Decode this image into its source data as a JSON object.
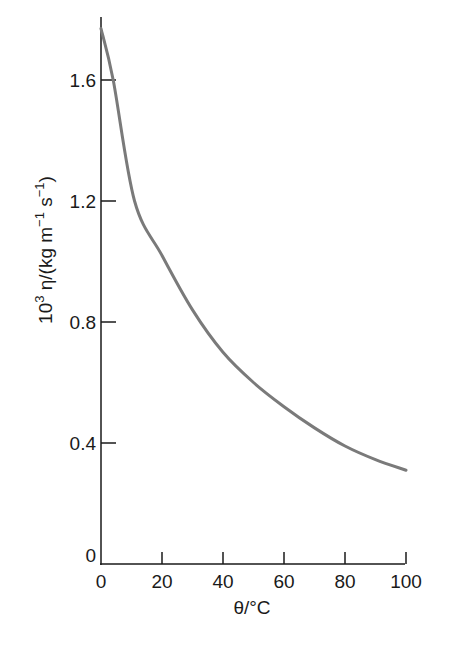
{
  "chart_data": {
    "type": "line",
    "title": "",
    "xlabel": "θ/°C",
    "ylabel": "10³ η/(kg m⁻¹ s⁻¹)",
    "ylabel_parts": {
      "base": "10",
      "exp": "3",
      "mid": " η/(kg m",
      "exp1": "−1",
      "mid2": " s",
      "exp2": "−1",
      "end": ")"
    },
    "xlim": [
      0,
      100
    ],
    "ylim": [
      0,
      1.8
    ],
    "grid": false,
    "legend": null,
    "x_ticks": [
      0,
      20,
      40,
      60,
      80,
      100
    ],
    "x_tick_labels": [
      "0",
      "20",
      "40",
      "60",
      "80",
      "100"
    ],
    "y_ticks": [
      0,
      0.4,
      0.8,
      1.2,
      1.6
    ],
    "y_tick_labels": [
      "0",
      "0.4",
      "0.8",
      "1.2",
      "1.6"
    ],
    "series": [
      {
        "name": "viscosity of water",
        "color": "#7a7a7a",
        "x": [
          0,
          4,
          11,
          20,
          30,
          40,
          50,
          60,
          70,
          80,
          90,
          100
        ],
        "y": [
          1.77,
          1.6,
          1.2,
          1.02,
          0.84,
          0.7,
          0.6,
          0.52,
          0.45,
          0.39,
          0.345,
          0.31
        ]
      }
    ]
  }
}
